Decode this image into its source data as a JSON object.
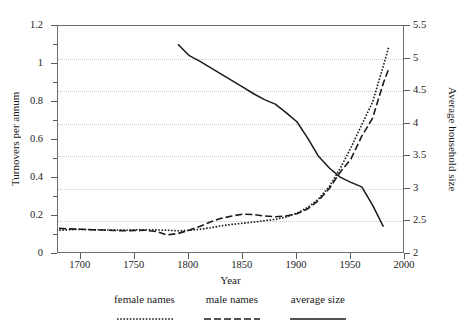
{
  "chart_data": {
    "type": "line",
    "title": "",
    "xlabel": "Year",
    "ylabel": "Turnovers per annum",
    "ylabel_right": "Average household size",
    "xlim": [
      1679,
      2000
    ],
    "ylim": [
      0,
      1.2
    ],
    "ylim_right": [
      2,
      5.5
    ],
    "grid": true,
    "grid_axis": "y-right",
    "legend_position": "below",
    "xticks": [
      1700,
      1750,
      1800,
      1850,
      1900,
      1950,
      2000
    ],
    "xtick_labels": [
      "1700",
      "1750",
      "1800",
      "1850",
      "1900",
      "1950",
      "2000"
    ],
    "yticks_left": [
      0,
      0.2,
      0.4,
      0.6,
      0.8,
      1,
      1.2
    ],
    "ytick_labels_left": [
      "0",
      "0.2",
      "0.4",
      "0.6",
      "0.8",
      "1",
      "1.2"
    ],
    "yticks_right": [
      2,
      2.5,
      3,
      3.5,
      4,
      4.5,
      5,
      5.5
    ],
    "ytick_labels_right": [
      "2",
      "2.5",
      "3",
      "3.5",
      "4",
      "4.5",
      "5",
      "5.5"
    ],
    "series": [
      {
        "name": "female names",
        "axis": "left",
        "style": "dotted",
        "color": "#1a1a1a",
        "x": [
          1680,
          1690,
          1700,
          1710,
          1720,
          1730,
          1740,
          1750,
          1760,
          1770,
          1780,
          1790,
          1800,
          1810,
          1820,
          1830,
          1840,
          1850,
          1860,
          1870,
          1880,
          1890,
          1900,
          1910,
          1920,
          1930,
          1940,
          1950,
          1960,
          1970,
          1980,
          1985
        ],
        "y": [
          0.125,
          0.128,
          0.13,
          0.128,
          0.127,
          0.126,
          0.126,
          0.127,
          0.128,
          0.127,
          0.125,
          0.122,
          0.124,
          0.13,
          0.138,
          0.148,
          0.156,
          0.162,
          0.168,
          0.175,
          0.182,
          0.195,
          0.215,
          0.245,
          0.29,
          0.355,
          0.45,
          0.56,
          0.68,
          0.8,
          0.99,
          1.09
        ]
      },
      {
        "name": "male names",
        "axis": "left",
        "style": "dashed",
        "color": "#1a1a1a",
        "x": [
          1680,
          1690,
          1700,
          1710,
          1720,
          1730,
          1740,
          1750,
          1760,
          1770,
          1780,
          1790,
          1800,
          1810,
          1820,
          1830,
          1840,
          1850,
          1860,
          1870,
          1880,
          1890,
          1900,
          1910,
          1920,
          1930,
          1940,
          1950,
          1960,
          1970,
          1980,
          1985
        ],
        "y": [
          0.135,
          0.132,
          0.13,
          0.128,
          0.126,
          0.124,
          0.122,
          0.124,
          0.125,
          0.118,
          0.1,
          0.108,
          0.125,
          0.145,
          0.168,
          0.188,
          0.2,
          0.21,
          0.208,
          0.2,
          0.196,
          0.2,
          0.212,
          0.238,
          0.282,
          0.345,
          0.43,
          0.5,
          0.62,
          0.715,
          0.9,
          0.975
        ]
      },
      {
        "name": "average size",
        "axis": "right",
        "style": "solid",
        "color": "#1a1a1a",
        "x": [
          1790,
          1800,
          1810,
          1820,
          1830,
          1840,
          1850,
          1860,
          1870,
          1880,
          1890,
          1900,
          1910,
          1920,
          1930,
          1940,
          1950,
          1960,
          1970,
          1980
        ],
        "y": [
          5.22,
          5.05,
          4.96,
          4.86,
          4.76,
          4.66,
          4.56,
          4.46,
          4.37,
          4.3,
          4.17,
          4.03,
          3.78,
          3.5,
          3.32,
          3.18,
          3.1,
          3.03,
          2.75,
          2.42
        ]
      }
    ]
  },
  "legend": {
    "items": [
      {
        "label": "female names",
        "style": "dotted"
      },
      {
        "label": "male names",
        "style": "dashed"
      },
      {
        "label": "average size",
        "style": "solid"
      }
    ]
  }
}
